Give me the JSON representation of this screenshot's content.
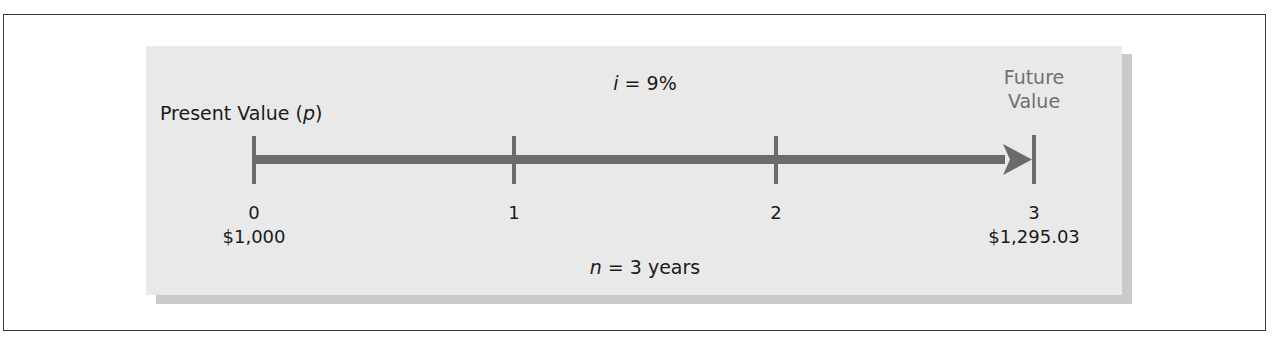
{
  "diagram": {
    "type": "time-value-of-money timeline",
    "rate_label": {
      "var": "i",
      "eq": " = 9%"
    },
    "duration_label": {
      "var": "n",
      "eq": " = 3 years"
    },
    "present_value_label": {
      "text": "Present Value (",
      "var": "p",
      "close": ")"
    },
    "future_value_label": {
      "line1": "Future",
      "line2": "Value"
    },
    "periods": [
      {
        "label": "0",
        "value": "$1,000"
      },
      {
        "label": "1",
        "value": ""
      },
      {
        "label": "2",
        "value": ""
      },
      {
        "label": "3",
        "value": "$1,295.03"
      }
    ],
    "colors": {
      "panel": "#e9e9e9",
      "panel_shadow": "#c9c9c9",
      "timeline": "#6b6b6b",
      "future_value_text": "#707070",
      "text": "#1a1a1a"
    }
  }
}
